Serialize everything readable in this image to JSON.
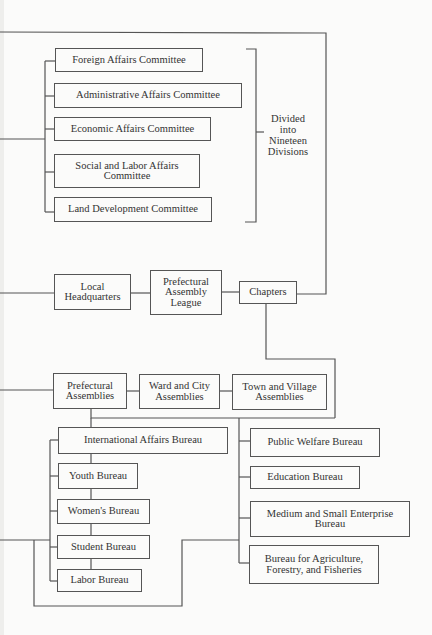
{
  "diagram": {
    "committees": [
      "Foreign Affairs Committee",
      "Administrative Affairs Committee",
      "Economic Affairs Committee",
      "Social and Labor Affairs Committee",
      "Land Development Committee"
    ],
    "committee_note": "Divided into Nineteen Divisions",
    "chain": [
      "Local Headquarters",
      "Prefectural Assembly League",
      "Chapters"
    ],
    "assemblies": [
      "Prefectural Assemblies",
      "Ward and City Assemblies",
      "Town and Village Assemblies"
    ],
    "left_bureaus": [
      "International Affairs Bureau",
      "Youth Bureau",
      "Women's Bureau",
      "Student Bureau",
      "Labor Bureau"
    ],
    "right_bureaus": [
      "Public Welfare Bureau",
      "Education Bureau",
      "Medium and Small Enterprise Bureau",
      "Bureau for Agriculture, Forestry, and Fisheries"
    ]
  }
}
